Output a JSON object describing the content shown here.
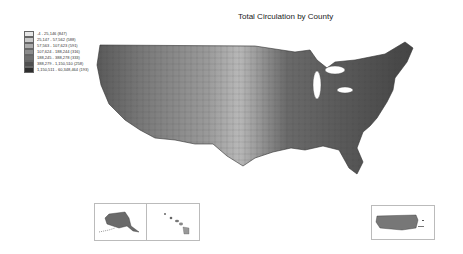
{
  "title": "Total Circulation by County",
  "legend": {
    "items": [
      {
        "label": "-4 - 25,146 (847)",
        "color": "#e6e6e6"
      },
      {
        "label": "25,147 - 57,562 (588)",
        "color": "#c8c8c8"
      },
      {
        "label": "57,563 - 107,623 (591)",
        "color": "#aaaaaa"
      },
      {
        "label": "107,624 - 188,244 (316)",
        "color": "#8c8c8c"
      },
      {
        "label": "188,245 - 388,278 (333)",
        "color": "#6e6e6e"
      },
      {
        "label": "388,279 - 1,150,510 (258)",
        "color": "#505050"
      },
      {
        "label": "1,150,511 - 60,348,464 (193)",
        "color": "#2e2e2e"
      }
    ]
  },
  "insets": [
    {
      "name": "Alaska"
    },
    {
      "name": "Hawaii"
    },
    {
      "name": "Puerto Rico"
    }
  ]
}
